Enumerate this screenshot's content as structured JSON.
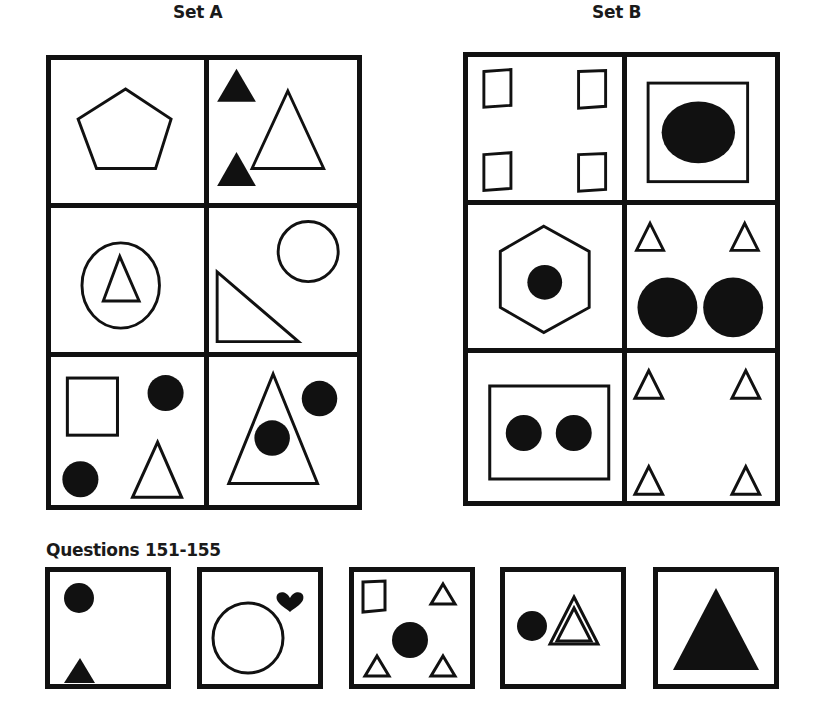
{
  "set_a": {
    "title": "Set A",
    "cells": [
      {
        "id": "a1",
        "contents": "outline pentagon"
      },
      {
        "id": "a2",
        "contents": "two small filled triangles, one large outline triangle"
      },
      {
        "id": "a3",
        "contents": "outline triangle inside outline oval"
      },
      {
        "id": "a4",
        "contents": "outline circle, outline right triangle"
      },
      {
        "id": "a5",
        "contents": "outline rectangle, two filled circles, outline triangle"
      },
      {
        "id": "a6",
        "contents": "large outline triangle containing filled circle, filled circle outside"
      }
    ]
  },
  "set_b": {
    "title": "Set B",
    "cells": [
      {
        "id": "b1",
        "contents": "four outline quadrilaterals in corners"
      },
      {
        "id": "b2",
        "contents": "filled ellipse inside outline square"
      },
      {
        "id": "b3",
        "contents": "filled circle inside outline hexagon"
      },
      {
        "id": "b4",
        "contents": "two small outline triangles, two large filled circles"
      },
      {
        "id": "b5",
        "contents": "two filled circles inside outline rectangle"
      },
      {
        "id": "b6",
        "contents": "four small outline triangles in corners"
      }
    ]
  },
  "questions": {
    "title": "Questions 151-155",
    "items": [
      {
        "number": "151",
        "contents": "filled circle, filled triangle"
      },
      {
        "number": "152",
        "contents": "outline circle, filled heart"
      },
      {
        "number": "153",
        "contents": "outline quadrilateral, three small outline triangles, filled circle"
      },
      {
        "number": "154",
        "contents": "filled circle, double-outline triangle"
      },
      {
        "number": "155",
        "contents": "large filled triangle"
      }
    ]
  }
}
